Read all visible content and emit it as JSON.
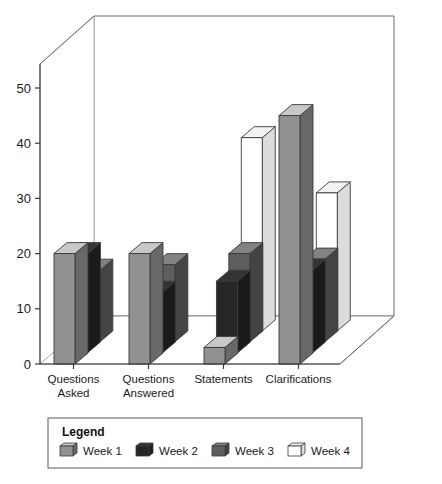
{
  "chart_data": {
    "type": "bar",
    "title": "",
    "subtitle": "",
    "xlabel": "",
    "ylabel": "",
    "categories": [
      "Questions Asked",
      "Questions Answered",
      "Statements",
      "Clarifications"
    ],
    "category_lines": [
      [
        "Questions",
        "Asked"
      ],
      [
        "Questions",
        "Answered"
      ],
      [
        "Statements"
      ],
      [
        "Clarifications"
      ]
    ],
    "series": [
      {
        "name": "Week 1",
        "values": [
          20,
          20,
          3,
          45
        ],
        "color": "#919191"
      },
      {
        "name": "Week 2",
        "values": [
          18,
          11,
          13,
          15
        ],
        "color": "#262626"
      },
      {
        "name": "Week 3",
        "values": [
          13,
          14,
          16,
          15
        ],
        "color": "#5e5e5e"
      },
      {
        "name": "Week 4",
        "values": [
          0,
          0,
          35,
          25
        ],
        "color": "#ffffff"
      }
    ],
    "ylim": [
      0,
      50
    ],
    "yticks": [
      0,
      10,
      20,
      30,
      40,
      50
    ],
    "ytick_labels": [
      "0",
      "10",
      "20",
      "30",
      "40",
      "50"
    ],
    "grid": true,
    "grid_axis": "y",
    "legend_position": "bottom",
    "legend_title": "Legend",
    "projection": "3d",
    "plot_background": "#ffffff",
    "axis_color": "#555555",
    "grid_color": "#d9d9d9"
  },
  "legend": {
    "title": "Legend",
    "items": [
      {
        "label": "Week 1",
        "color": "#919191"
      },
      {
        "label": "Week 2",
        "color": "#262626"
      },
      {
        "label": "Week 3",
        "color": "#5e5e5e"
      },
      {
        "label": "Week 4",
        "color": "#ffffff"
      }
    ]
  },
  "axis": {
    "y_tick_labels": [
      "50",
      "40",
      "30",
      "20",
      "10",
      "0"
    ]
  }
}
